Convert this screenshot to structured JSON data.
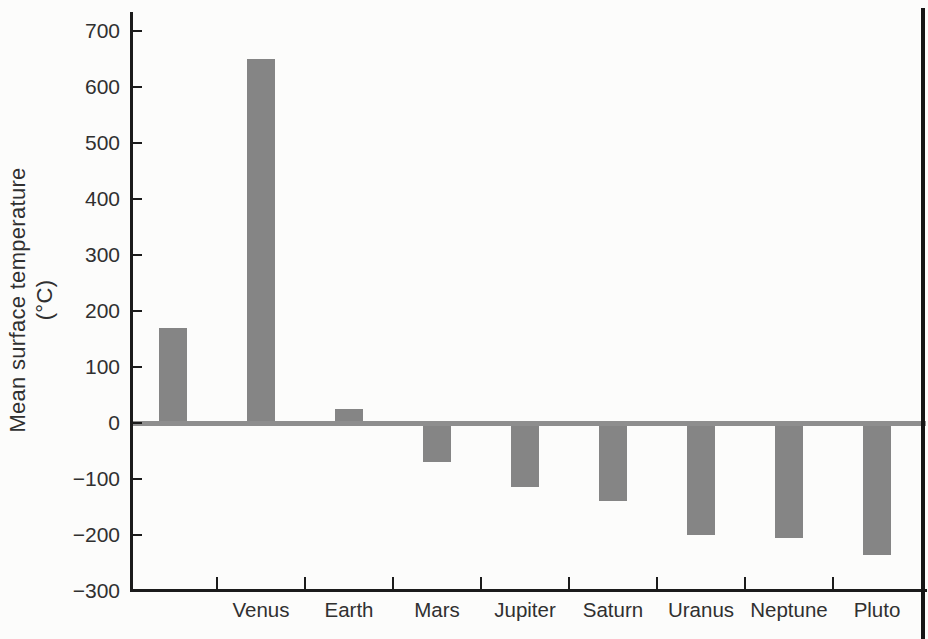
{
  "palette": {
    "background": "#fcfcfb",
    "bar": "#858585",
    "axis": "#1b1b1b",
    "zero_line": "#8e8e8e",
    "text": "#303030",
    "page_edge": "#151515"
  },
  "chart_data": {
    "type": "bar",
    "title": "",
    "ylabel": "Mean surface temperature (°C)",
    "ylabel_line1": "Mean surface temperature",
    "ylabel_line2": "(°C)",
    "xlabel": "",
    "categories": [
      "",
      "Venus",
      "Earth",
      "Mars",
      "Jupiter",
      "Saturn",
      "Uranus",
      "Neptune",
      "Pluto"
    ],
    "values": [
      170,
      650,
      25,
      -70,
      -115,
      -140,
      -200,
      -205,
      -235
    ],
    "y_ticks": [
      700,
      600,
      500,
      400,
      300,
      200,
      100,
      0,
      -100,
      -200,
      -300
    ],
    "y_tick_labels": [
      "700",
      "600",
      "500",
      "400",
      "300",
      "200",
      "100",
      "0",
      "−100",
      "−200",
      "−300"
    ],
    "ylim": [
      -300,
      740
    ],
    "grid": false,
    "legend": "none",
    "zero_line": true
  }
}
